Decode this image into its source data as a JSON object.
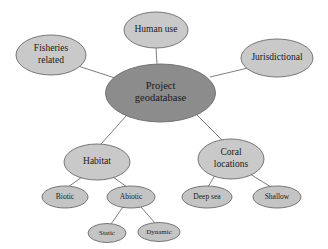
{
  "figure": {
    "background_color": "#ffffff",
    "root_label": "Project geodatabase"
  },
  "style": {
    "root_fill": "#8c8c8c",
    "node_fill": "#c9c9c9",
    "leaf_fill": "#c4c4c4",
    "stroke_color": "#6b6b6b",
    "edge_color": "#6e6e6e",
    "text_color": "#1a1a1a"
  },
  "chart_data": {
    "type": "diagram",
    "layout": "radial node-link tree",
    "nodes": [
      {
        "id": "root",
        "label_lines": [
          "Project",
          "geodatabase"
        ],
        "level": 0,
        "cx": 160.5,
        "cy": 93,
        "rx": 55,
        "ry": 29,
        "fill": "#8c8c8c",
        "font_size": 10.5
      },
      {
        "id": "human-use",
        "label_lines": [
          "Human use"
        ],
        "level": 1,
        "cx": 156,
        "cy": 30,
        "rx": 32,
        "ry": 18,
        "fill": "#c9c9c9",
        "font_size": 9.5
      },
      {
        "id": "fisheries-related",
        "label_lines": [
          "Fisheries",
          "related"
        ],
        "level": 1,
        "cx": 51,
        "cy": 55,
        "rx": 35,
        "ry": 20,
        "fill": "#c9c9c9",
        "font_size": 9.5
      },
      {
        "id": "jurisdictional",
        "label_lines": [
          "Jurisdictional"
        ],
        "level": 1,
        "cx": 277,
        "cy": 58,
        "rx": 36,
        "ry": 19,
        "fill": "#c9c9c9",
        "font_size": 9.5
      },
      {
        "id": "habitat",
        "label_lines": [
          "Habitat"
        ],
        "level": 1,
        "cx": 97,
        "cy": 162,
        "rx": 33,
        "ry": 18,
        "fill": "#c9c9c9",
        "font_size": 9.5
      },
      {
        "id": "coral-locations",
        "label_lines": [
          "Coral",
          "locations"
        ],
        "level": 1,
        "cx": 231,
        "cy": 159,
        "rx": 33,
        "ry": 20,
        "fill": "#c9c9c9",
        "font_size": 9.5
      },
      {
        "id": "biotic",
        "label_lines": [
          "Biotic"
        ],
        "level": 2,
        "cx": 65,
        "cy": 197,
        "rx": 23,
        "ry": 11,
        "fill": "#c4c4c4",
        "font_size": 7.5
      },
      {
        "id": "abiotic",
        "label_lines": [
          "Abiotic"
        ],
        "level": 2,
        "cx": 131,
        "cy": 197,
        "rx": 24,
        "ry": 11,
        "fill": "#c4c4c4",
        "font_size": 7.5
      },
      {
        "id": "deep-sea",
        "label_lines": [
          "Deep sea"
        ],
        "level": 2,
        "cx": 207,
        "cy": 197,
        "rx": 25,
        "ry": 11,
        "fill": "#c4c4c4",
        "font_size": 7.5
      },
      {
        "id": "shallow",
        "label_lines": [
          "Shallow"
        ],
        "level": 2,
        "cx": 277,
        "cy": 197,
        "rx": 24,
        "ry": 11,
        "fill": "#c4c4c4",
        "font_size": 7.5
      },
      {
        "id": "static",
        "label_lines": [
          "Static"
        ],
        "level": 3,
        "cx": 107,
        "cy": 233,
        "rx": 19,
        "ry": 9.5,
        "fill": "#c4c4c4",
        "font_size": 7
      },
      {
        "id": "dynamic",
        "label_lines": [
          "Dynamic"
        ],
        "level": 3,
        "cx": 159,
        "cy": 232,
        "rx": 21,
        "ry": 9.5,
        "fill": "#c4c4c4",
        "font_size": 7
      }
    ],
    "edges": [
      {
        "from": "root",
        "to": "human-use",
        "x1": 157,
        "y1": 64,
        "x2": 156,
        "y2": 48
      },
      {
        "from": "root",
        "to": "fisheries-related",
        "x1": 115,
        "y1": 78,
        "x2": 78,
        "y2": 66
      },
      {
        "from": "root",
        "to": "jurisdictional",
        "x1": 210,
        "y1": 77,
        "x2": 248,
        "y2": 68
      },
      {
        "from": "root",
        "to": "habitat",
        "x1": 127,
        "y1": 115,
        "x2": 101,
        "y2": 144
      },
      {
        "from": "root",
        "to": "coral-locations",
        "x1": 196,
        "y1": 114,
        "x2": 222,
        "y2": 140
      },
      {
        "from": "habitat",
        "to": "biotic",
        "x1": 82,
        "y1": 177,
        "x2": 68,
        "y2": 187
      },
      {
        "from": "habitat",
        "to": "abiotic",
        "x1": 113,
        "y1": 177,
        "x2": 127,
        "y2": 187
      },
      {
        "from": "abiotic",
        "to": "static",
        "x1": 123,
        "y1": 207,
        "x2": 111,
        "y2": 224
      },
      {
        "from": "abiotic",
        "to": "dynamic",
        "x1": 141,
        "y1": 207,
        "x2": 155,
        "y2": 223
      },
      {
        "from": "coral-locations",
        "to": "deep-sea",
        "x1": 215,
        "y1": 175,
        "x2": 208,
        "y2": 187
      },
      {
        "from": "coral-locations",
        "to": "shallow",
        "x1": 250,
        "y1": 174,
        "x2": 271,
        "y2": 187
      }
    ],
    "hierarchy": {
      "Project geodatabase": {
        "Human use": {},
        "Fisheries related": {},
        "Jurisdictional": {},
        "Habitat": {
          "Biotic": {},
          "Abiotic": {
            "Static": {},
            "Dynamic": {}
          }
        },
        "Coral locations": {
          "Deep sea": {},
          "Shallow": {}
        }
      }
    }
  }
}
